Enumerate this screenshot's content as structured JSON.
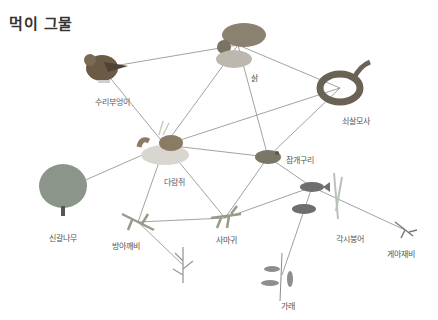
{
  "title": "먹이 그물",
  "colors": {
    "line": "#8a8a8a",
    "title": "#333333",
    "label": "#555555"
  },
  "nodes": [
    {
      "id": "owl",
      "label": "수리부엉이",
      "icon": "owl-icon",
      "x": 102,
      "y": 68,
      "lx": 112,
      "ly": 96
    },
    {
      "id": "wildcat",
      "label": "삵",
      "icon": "wildcat-icon",
      "x": 238,
      "y": 45,
      "lx": 254,
      "ly": 72
    },
    {
      "id": "snake",
      "label": "쇠살모사",
      "icon": "snake-icon",
      "x": 340,
      "y": 88,
      "lx": 356,
      "ly": 115
    },
    {
      "id": "chipmunk",
      "label": "다람쥐",
      "icon": "chipmunk-icon",
      "x": 165,
      "y": 145,
      "lx": 174,
      "ly": 176
    },
    {
      "id": "frog",
      "label": "참개구리",
      "icon": "frog-icon",
      "x": 268,
      "y": 157,
      "lx": 300,
      "ly": 154
    },
    {
      "id": "tree",
      "label": "신갈나무",
      "icon": "tree-icon",
      "x": 63,
      "y": 190,
      "lx": 63,
      "ly": 232
    },
    {
      "id": "grasshopper",
      "label": "방아깨비",
      "icon": "grasshopper-icon",
      "x": 138,
      "y": 222,
      "lx": 126,
      "ly": 240
    },
    {
      "id": "mantis",
      "label": "사마귀",
      "icon": "mantis-icon",
      "x": 225,
      "y": 218,
      "lx": 226,
      "ly": 234
    },
    {
      "id": "bitterling",
      "label": "각시붕어",
      "icon": "fish-icon",
      "x": 312,
      "y": 187,
      "lx": 350,
      "ly": 233
    },
    {
      "id": "waterbug",
      "label": "게아재비",
      "icon": "water-bug-icon",
      "x": 405,
      "y": 230,
      "lx": 401,
      "ly": 248
    },
    {
      "id": "pondweed",
      "label": "가래",
      "icon": "pondweed-icon",
      "x": 282,
      "y": 275,
      "lx": 288,
      "ly": 300
    },
    {
      "id": "grass",
      "label": "",
      "icon": "grass-icon",
      "x": 183,
      "y": 265,
      "lx": 0,
      "ly": 0
    }
  ],
  "edges": [
    [
      "owl",
      "wildcat"
    ],
    [
      "owl",
      "chipmunk"
    ],
    [
      "wildcat",
      "chipmunk"
    ],
    [
      "wildcat",
      "frog"
    ],
    [
      "wildcat",
      "snake"
    ],
    [
      "snake",
      "chipmunk"
    ],
    [
      "snake",
      "frog"
    ],
    [
      "chipmunk",
      "tree"
    ],
    [
      "chipmunk",
      "frog"
    ],
    [
      "chipmunk",
      "grasshopper"
    ],
    [
      "chipmunk",
      "mantis"
    ],
    [
      "frog",
      "mantis"
    ],
    [
      "frog",
      "bitterling"
    ],
    [
      "grasshopper",
      "mantis"
    ],
    [
      "grasshopper",
      "grass"
    ],
    [
      "mantis",
      "bitterling"
    ],
    [
      "bitterling",
      "pondweed"
    ],
    [
      "waterbug",
      "bitterling"
    ]
  ]
}
